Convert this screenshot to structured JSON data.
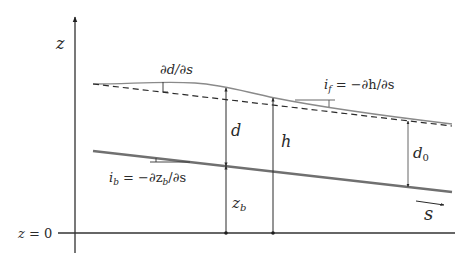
{
  "diagram": {
    "type": "open-channel flow schematic",
    "axes": {
      "vertical_label": "z",
      "datum_label": "z = 0",
      "flow_direction_label": "s"
    },
    "lines": {
      "water_surface": "solid gray curve (actual water surface)",
      "uniform_surface": "dashed line parallel to bed",
      "bed": "thick gray sloping line"
    },
    "labels": {
      "dd_ds": "∂d/∂s",
      "i_f": "i",
      "i_f_sub": "f",
      "i_f_rhs": " = −∂h/∂s",
      "i_b": "i",
      "i_b_sub": "b",
      "i_b_rhs_1": " = −∂z",
      "i_b_rhs_sub": "b",
      "i_b_rhs_2": "/∂s",
      "d": "d",
      "h": "h",
      "d0": "d",
      "d0_sub": "0",
      "zb": "z",
      "zb_sub": "b",
      "z": "z",
      "z0_z": "z",
      "z0_rest": " = 0",
      "s": "s"
    },
    "colors": {
      "ink": "#2a2a2a",
      "surface_gray": "#8a8a8a",
      "bed_gray": "#707070",
      "axis": "#1e1e1e"
    }
  }
}
